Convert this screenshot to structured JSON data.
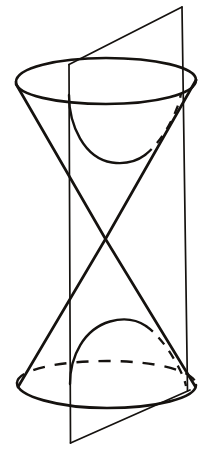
{
  "figure": {
    "caption": "",
    "background_color": "#ffffff",
    "ink_color": "#15120f",
    "canvas": {
      "width": 212,
      "height": 472
    },
    "elements": {
      "top_rim_ellipse": {
        "name": "top-circular-rim",
        "cx": 106,
        "cy": 80,
        "rx": 90,
        "ry": 23,
        "style": "solid",
        "stroke_width": 2.4
      },
      "bottom_rim_ellipse": {
        "name": "bottom-circular-rim",
        "cx": 106,
        "cy": 384,
        "rx": 89,
        "ry": 23,
        "style": "front-solid-back-dashed",
        "stroke_width": 2.4,
        "dash_pattern": "11 9"
      },
      "upper_nappe_left_slant": {
        "name": "upper-cone-left-generator",
        "from": [
          16,
          84
        ],
        "to": [
          105,
          239
        ],
        "style": "solid",
        "stroke_width": 2.5
      },
      "upper_nappe_right_slant": {
        "name": "upper-cone-right-generator",
        "from": [
          196,
          80
        ],
        "to": [
          105,
          239
        ],
        "style": "solid",
        "stroke_width": 2.5
      },
      "lower_nappe_left_slant": {
        "name": "lower-cone-left-generator",
        "from": [
          105,
          239
        ],
        "to": [
          18,
          387
        ],
        "style": "solid",
        "stroke_width": 2.5
      },
      "lower_nappe_right_slant": {
        "name": "lower-cone-right-generator",
        "from": [
          105,
          239
        ],
        "to": [
          195,
          385
        ],
        "style": "solid",
        "stroke_width": 2.5
      },
      "apex": {
        "name": "cone-apex",
        "point": [
          105,
          239
        ]
      },
      "plane_left_edge": {
        "name": "cutting-plane-left-vertical-edge",
        "from": [
          69,
          64
        ],
        "to": [
          70,
          443
        ],
        "style": "solid",
        "stroke_width": 1.6
      },
      "plane_right_edge": {
        "name": "cutting-plane-right-vertical-edge",
        "from": [
          182,
          7
        ],
        "to": [
          187,
          391
        ],
        "style": "solid",
        "stroke_width": 1.6
      },
      "plane_top_edge": {
        "name": "cutting-plane-top-edge",
        "from": [
          69,
          64
        ],
        "to": [
          182,
          7
        ],
        "style": "solid",
        "stroke_width": 1.6
      },
      "plane_bottom_edge": {
        "name": "cutting-plane-bottom-edge",
        "from": [
          70,
          443
        ],
        "to": [
          190,
          390
        ],
        "style": "solid",
        "stroke_width": 1.6
      },
      "upper_hyperbola_branch": {
        "name": "upper-hyperbola-branch",
        "description": "U-shaped curve on upper nappe, open upward",
        "endpoints": [
          [
            69,
            96
          ],
          [
            181,
            92
          ]
        ],
        "vertex": [
          120,
          162
        ],
        "style": "solid-with-dashed-right-tail",
        "stroke_width": 2.3
      },
      "lower_hyperbola_branch": {
        "name": "lower-hyperbola-branch",
        "description": "Arch-shaped curve on lower nappe, open downward",
        "endpoints": [
          [
            70,
            384
          ],
          [
            186,
            386
          ]
        ],
        "vertex": [
          122,
          321
        ],
        "style": "solid-with-dashed-right-tail",
        "stroke_width": 2.3
      }
    }
  }
}
